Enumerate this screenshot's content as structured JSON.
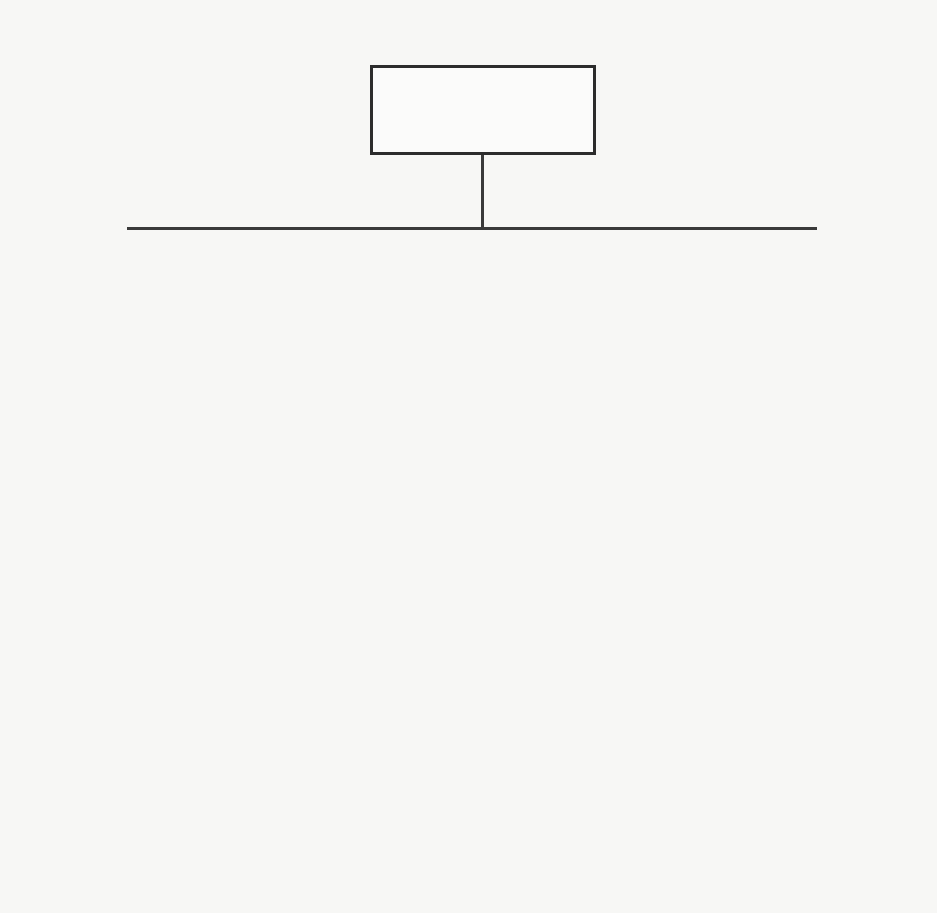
{
  "root": {
    "label": "Machine Learning"
  },
  "branches": [
    {
      "label": "Unsupervised Learning",
      "subcategories": [
        {
          "label": "Clustering",
          "items": [
            "Hidden Markov Models",
            "Fuzzy C-Means",
            "Apriori",
            "K- Means",
            "Hierarchical Clustering.",
            "Probabilistic Clustering",
            "Deep Learning & Neural Network"
          ]
        }
      ]
    },
    {
      "label": "Supervised Learning",
      "subcategories": [
        {
          "label": "Regression",
          "items": [
            "Linear Regression",
            "Neural Networks",
            "Decision Tree",
            "Ensemble Methods",
            "Stochastic Gradient Descent"
          ]
        },
        {
          "label": "Classification",
          "items": [
            "Logistic Regression",
            "Decision Tree",
            "Naïve Bayse",
            "Random Forest",
            "Support Vector Machine",
            "K-Nearest Neighbours",
            "Discernment Analysis"
          ]
        }
      ]
    },
    {
      "label": "Reinforcement Learning",
      "items": [
        "Q-Learning",
        "Deep Adversarial Networks",
        "Markov Decision Process",
        "Artificial Neural Networks"
      ]
    }
  ]
}
